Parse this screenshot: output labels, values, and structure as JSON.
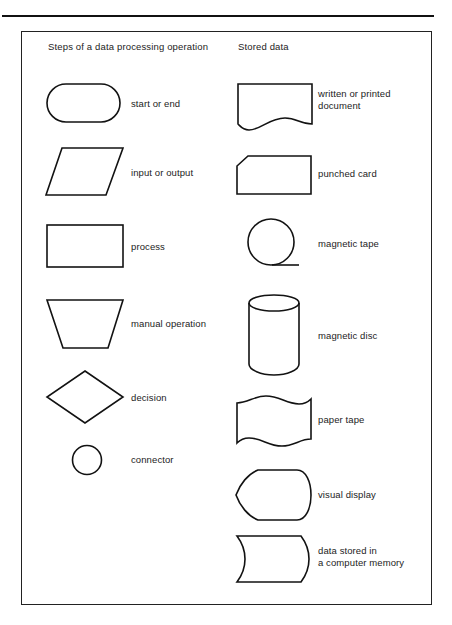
{
  "page": {
    "background_color": "#ffffff",
    "stroke_color": "#121212",
    "text_color": "#1c1c1c"
  },
  "columns": {
    "left_header": "Steps of a data processing operation",
    "right_header": "Stored data"
  },
  "left_column": [
    {
      "icon": "stadium-shape-icon",
      "label": "start or end"
    },
    {
      "icon": "parallelogram-shape-icon",
      "label": "input or output"
    },
    {
      "icon": "rectangle-shape-icon",
      "label": "process"
    },
    {
      "icon": "trapezoid-shape-icon",
      "label": "manual operation"
    },
    {
      "icon": "diamond-shape-icon",
      "label": "decision"
    },
    {
      "icon": "circle-shape-icon",
      "label": "connector"
    }
  ],
  "right_column": [
    {
      "icon": "document-shape-icon",
      "label": "written or printed\ndocument"
    },
    {
      "icon": "punched-card-shape-icon",
      "label": "punched card"
    },
    {
      "icon": "magnetic-tape-shape-icon",
      "label": "magnetic tape"
    },
    {
      "icon": "cylinder-shape-icon",
      "label": "magnetic disc"
    },
    {
      "icon": "paper-tape-shape-icon",
      "label": "paper tape"
    },
    {
      "icon": "visual-display-shape-icon",
      "label": "visual display"
    },
    {
      "icon": "stored-memory-shape-icon",
      "label": "data stored in\na computer memory"
    }
  ]
}
